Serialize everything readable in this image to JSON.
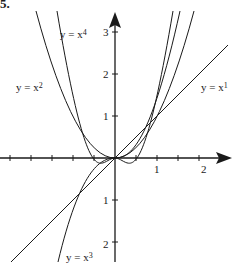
{
  "problem_number": "5.",
  "curves": [
    {
      "id": "x1",
      "label_base": "y = x",
      "label_exp": "1"
    },
    {
      "id": "x2",
      "label_base": "y = x",
      "label_exp": "2"
    },
    {
      "id": "x3",
      "label_base": "y = x",
      "label_exp": "3"
    },
    {
      "id": "x4",
      "label_base": "y = x",
      "label_exp": "4"
    }
  ],
  "axes": {
    "x_ticks": [
      "1",
      "2"
    ],
    "y_ticks_pos": [
      "1",
      "2",
      "3"
    ],
    "y_ticks_neg": [
      "1",
      "2"
    ]
  },
  "colors": {
    "ink": "#1a1a1a",
    "background": "#ffffff"
  }
}
